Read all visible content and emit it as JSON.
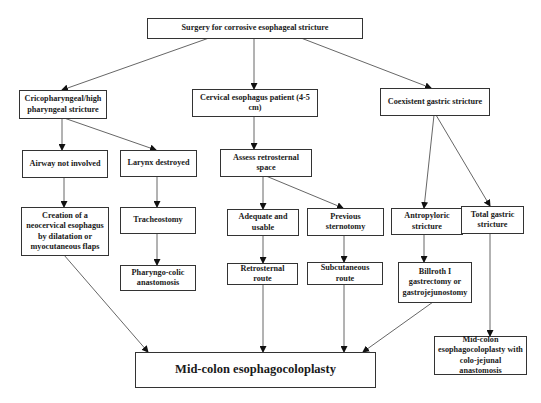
{
  "diagram": {
    "type": "flowchart",
    "colors": {
      "line": "#555555",
      "border": "#333333",
      "text": "#1a1a1a",
      "background": "#ffffff"
    },
    "nodes": {
      "root": {
        "label": "Surgery for corrosive esophageal stricture"
      },
      "crico": {
        "label": "Cricopharyngeal/high pharyngeal stricture"
      },
      "cervical": {
        "label": "Cervical esophagus patient (4-5 cm)"
      },
      "coexistent": {
        "label": "Coexistent gastric stricture"
      },
      "airway": {
        "label": "Airway not involved"
      },
      "larynx": {
        "label": "Larynx destroyed"
      },
      "assess": {
        "label": "Assess retrosternal space"
      },
      "creation": {
        "label": "Creation of a neocervical esophagus by dilatation or myocutaneous flaps"
      },
      "tracheostomy": {
        "label": "Tracheostomy"
      },
      "adequate": {
        "label": "Adequate and usable"
      },
      "previous": {
        "label": "Previous sternotomy"
      },
      "antropyloric": {
        "label": "Antropyloric stricture"
      },
      "total": {
        "label": "Total gastric stricture"
      },
      "pharyngo": {
        "label": "Pharyngo-colic anastomosis"
      },
      "retro_route": {
        "label": "Retrosternal route"
      },
      "subcut_route": {
        "label": "Subcutaneous route"
      },
      "billroth": {
        "label": "Billroth I gastrectomy or gastrojejunostomy"
      },
      "midcolon": {
        "label": "Mid-colon esophagocoloplasty"
      },
      "midcolon_jejunal": {
        "label": "Mid-colon esophagocoloplasty with colo-jejunal anastomosis"
      }
    },
    "edges": [
      [
        "root",
        "crico"
      ],
      [
        "root",
        "cervical"
      ],
      [
        "root",
        "coexistent"
      ],
      [
        "crico",
        "airway"
      ],
      [
        "crico",
        "larynx"
      ],
      [
        "cervical",
        "assess"
      ],
      [
        "coexistent",
        "antropyloric"
      ],
      [
        "coexistent",
        "total"
      ],
      [
        "airway",
        "creation"
      ],
      [
        "larynx",
        "tracheostomy"
      ],
      [
        "assess",
        "adequate"
      ],
      [
        "assess",
        "previous"
      ],
      [
        "tracheostomy",
        "pharyngo"
      ],
      [
        "adequate",
        "retro_route"
      ],
      [
        "previous",
        "subcut_route"
      ],
      [
        "antropyloric",
        "billroth"
      ],
      [
        "total",
        "midcolon_jejunal"
      ],
      [
        "creation",
        "midcolon"
      ],
      [
        "retro_route",
        "midcolon"
      ],
      [
        "subcut_route",
        "midcolon"
      ],
      [
        "billroth",
        "midcolon"
      ]
    ]
  }
}
